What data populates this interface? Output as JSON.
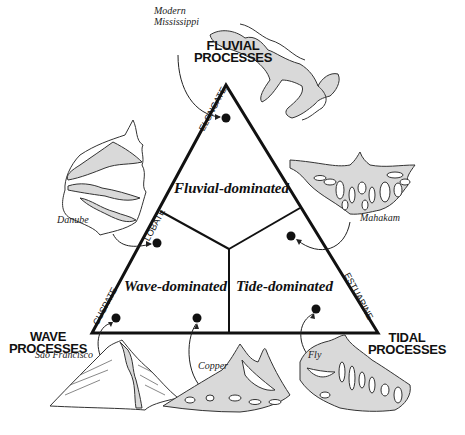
{
  "processes": {
    "fluvial": "FLUVIAL PROCESSES",
    "fluvial_l1": "FLUVIAL",
    "fluvial_l2": "PROCESSES",
    "wave_l1": "WAVE",
    "wave_l2": "PROCESSES",
    "tidal_l1": "TIDAL",
    "tidal_l2": "PROCESSES"
  },
  "regions": {
    "fluvial": "Fluvial-dominated",
    "wave": "Wave-dominated",
    "tide": "Tide-dominated"
  },
  "shapes": {
    "elongate": "ELONGATE",
    "lobate": "LOBATE",
    "cuspate": "CUSPATE",
    "estuarine": "ESTUARINE"
  },
  "deltas": [
    {
      "name_l1": "Modern",
      "name_l2": "Mississippi"
    },
    {
      "name": "Danube"
    },
    {
      "name": "Mahakam"
    },
    {
      "name": "São Francisco"
    },
    {
      "name": "Copper"
    },
    {
      "name": "Fly"
    }
  ],
  "colors": {
    "line": "#111111",
    "fill": "#d9d9d9"
  }
}
